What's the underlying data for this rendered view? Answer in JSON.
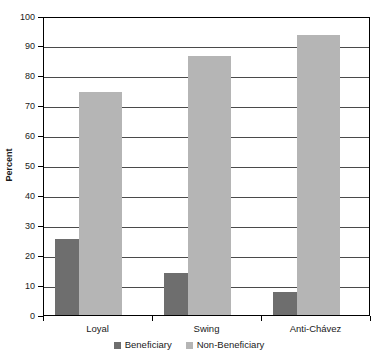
{
  "chart_data": {
    "type": "bar",
    "title": "",
    "subtitle": "",
    "xlabel": "",
    "ylabel": "Percent",
    "categories": [
      "Loyal",
      "Swing",
      "Anti-Chávez"
    ],
    "series": [
      {
        "name": "Beneficiary",
        "color": "#6e6e6e",
        "values": [
          25.4,
          14.0,
          7.7
        ]
      },
      {
        "name": "Non-Beneficiary",
        "color": "#b5b5b5",
        "values": [
          74.6,
          86.6,
          93.5
        ]
      }
    ],
    "ylim": [
      0,
      100
    ],
    "ytick_step": 10,
    "yticks": [
      0,
      10,
      20,
      30,
      40,
      50,
      60,
      70,
      80,
      90,
      100
    ],
    "ytick_labels": [
      "0",
      "10",
      "20",
      "30",
      "40",
      "50",
      "60",
      "70",
      "80",
      "90",
      "100"
    ],
    "grid": true,
    "grid_axis": "y",
    "legend_position": "bottom",
    "legend_entries": [
      "Beneficiary",
      "Non-Beneficiary"
    ],
    "frame": true,
    "background_color": "#ffffff",
    "axis_color": "#000000",
    "gridline_color": "#4a4a4a"
  }
}
